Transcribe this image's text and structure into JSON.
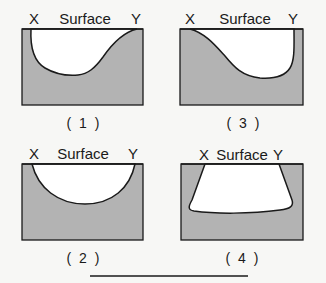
{
  "colors": {
    "background": "#f7f7f5",
    "soil": "#b3b3b3",
    "cavity": "#ffffff",
    "outline": "#1a1a1a"
  },
  "panels": [
    {
      "id": 1,
      "caption": "( 1 )",
      "left_label": "X",
      "surface_label": "Surface",
      "right_label": "Y"
    },
    {
      "id": 3,
      "caption": "( 3 )",
      "left_label": "X",
      "surface_label": "Surface",
      "right_label": "Y"
    },
    {
      "id": 2,
      "caption": "( 2 )",
      "left_label": "X",
      "surface_label": "Surface",
      "right_label": "Y"
    },
    {
      "id": 4,
      "caption": "( 4 )",
      "left_label": "X",
      "surface_label": "Surface",
      "right_label": "Y"
    }
  ]
}
